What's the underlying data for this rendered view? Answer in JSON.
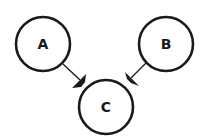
{
  "diagram": {
    "nodes": [
      {
        "id": "A",
        "label": "A"
      },
      {
        "id": "B",
        "label": "B"
      },
      {
        "id": "C",
        "label": "C"
      }
    ],
    "edges": [
      {
        "from": "A",
        "to": "C"
      },
      {
        "from": "B",
        "to": "C"
      }
    ],
    "colors": {
      "stroke": "#1a1a1a",
      "fill": "#ffffff"
    }
  }
}
